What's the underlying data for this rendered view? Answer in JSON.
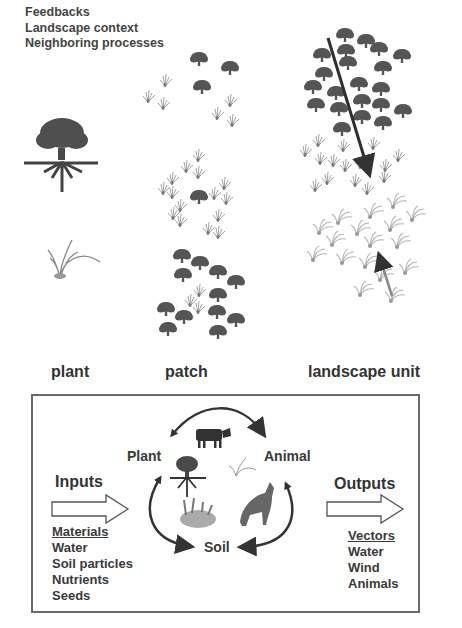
{
  "top_labels": [
    "Feedbacks",
    "Landscape context",
    "Neighboring processes"
  ],
  "scales": {
    "plant": "plant",
    "patch": "patch",
    "landscape": "landscape unit"
  },
  "cycle": {
    "nodes": {
      "plant": "Plant",
      "animal": "Animal",
      "soil": "Soil"
    },
    "icons": [
      "cow-icon",
      "tree-icon",
      "grass-icon",
      "soil-plant-icon",
      "wolf-icon"
    ]
  },
  "inputs": {
    "title": "Inputs",
    "header": "Materials",
    "items": [
      "Water",
      "Soil particles",
      "Nutrients",
      "Seeds"
    ]
  },
  "outputs": {
    "title": "Outputs",
    "header": "Vectors",
    "items": [
      "Water",
      "Wind",
      "Animals"
    ]
  },
  "colors": {
    "tree": "#4a4a4a",
    "grass": "#9a9a9a",
    "arrow": "#333333",
    "box_border": "#6a6a6a"
  }
}
